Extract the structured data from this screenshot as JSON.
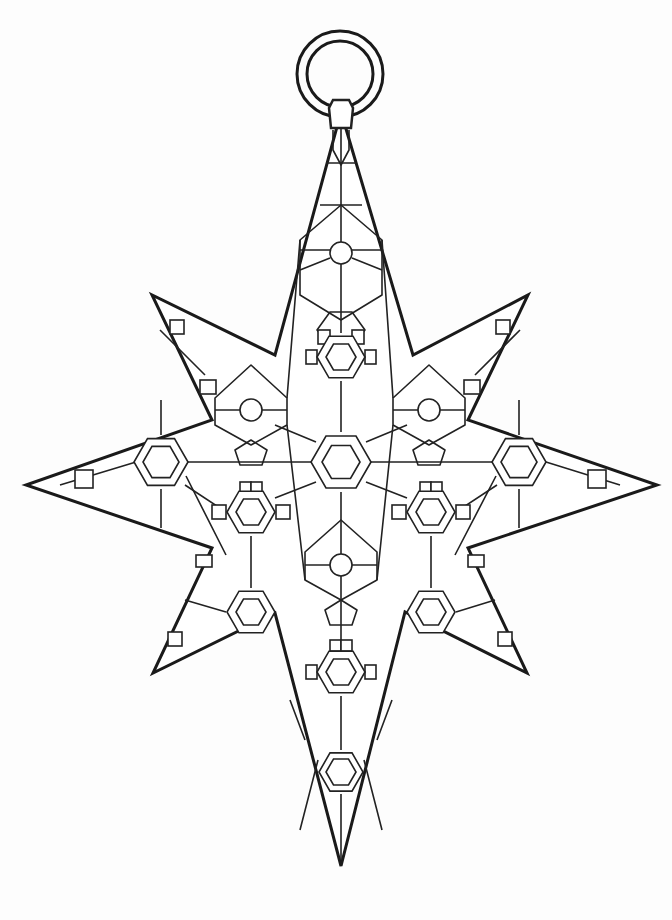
{
  "artwork": {
    "title": "Star ornament coloring page",
    "stroke_color": "#1a1a1a",
    "background": "#fdfdfd",
    "fill": "#ffffff"
  },
  "hanger": {
    "ring": {
      "cx": 340,
      "cy": 74,
      "r_outer": 43,
      "r_inner": 33
    },
    "cap": {
      "x": 341,
      "top": 98,
      "bottom": 130
    }
  },
  "star_outline": [
    [
      341,
      112
    ],
    [
      413,
      355
    ],
    [
      528,
      295
    ],
    [
      468,
      420
    ],
    [
      657,
      485
    ],
    [
      468,
      548
    ],
    [
      527,
      673
    ],
    [
      405,
      612
    ],
    [
      341,
      866
    ],
    [
      275,
      613
    ],
    [
      153,
      673
    ],
    [
      212,
      548
    ],
    [
      26,
      485
    ],
    [
      212,
      420
    ],
    [
      152,
      295
    ],
    [
      275,
      355
    ]
  ],
  "hexagon_medallions": [
    {
      "name": "center",
      "cx": 341,
      "cy": 462,
      "r": 30,
      "ri": 19
    },
    {
      "name": "upper",
      "cx": 341,
      "cy": 357,
      "r": 24,
      "ri": 15
    },
    {
      "name": "left-mid",
      "cx": 251,
      "cy": 512,
      "r": 24,
      "ri": 15
    },
    {
      "name": "right-mid",
      "cx": 431,
      "cy": 512,
      "r": 24,
      "ri": 15
    },
    {
      "name": "lower",
      "cx": 341,
      "cy": 672,
      "r": 24,
      "ri": 15
    },
    {
      "name": "left-tip",
      "cx": 161,
      "cy": 462,
      "r": 27,
      "ri": 18
    },
    {
      "name": "right-tip",
      "cx": 519,
      "cy": 462,
      "r": 27,
      "ri": 18
    },
    {
      "name": "bottom",
      "cx": 341,
      "cy": 772,
      "r": 22,
      "ri": 15
    },
    {
      "name": "lower-left",
      "cx": 251,
      "cy": 612,
      "r": 24,
      "ri": 15
    },
    {
      "name": "lower-right",
      "cx": 431,
      "cy": 612,
      "r": 24,
      "ri": 15
    }
  ],
  "circle_nodes": [
    {
      "cx": 341,
      "cy": 253,
      "r": 11
    },
    {
      "cx": 251,
      "cy": 410,
      "r": 11
    },
    {
      "cx": 429,
      "cy": 410,
      "r": 11
    },
    {
      "cx": 341,
      "cy": 565,
      "r": 11
    }
  ]
}
